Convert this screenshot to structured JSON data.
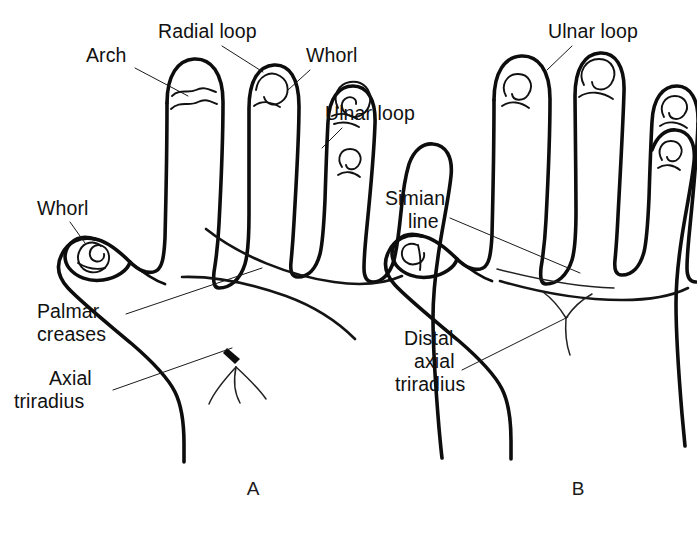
{
  "figure": {
    "background_color": "#ffffff",
    "ink_color": "#0d0d0d",
    "width": 697,
    "height": 533
  },
  "panels": [
    {
      "id": "A",
      "caption": "A",
      "caption_x": 253,
      "caption_y": 495,
      "description": "Normal hand with varied fingertip patterns, two palmar creases and an axial triradius"
    },
    {
      "id": "B",
      "caption": "B",
      "caption_x": 578,
      "caption_y": 495,
      "description": "Hand showing a single simian line and a distal axial triradius with ulnar loops on all digits"
    }
  ],
  "labels": [
    {
      "id": "arch",
      "text": "Arch",
      "panel": "A",
      "x": 86,
      "y": 62,
      "anchor": "start",
      "leader": [
        [
          135,
          68
        ],
        [
          188,
          96
        ]
      ]
    },
    {
      "id": "radial-loop",
      "text": "Radial loop",
      "panel": "A",
      "x": 158,
      "y": 38,
      "anchor": "start",
      "leader": [
        [
          222,
          46
        ],
        [
          263,
          72
        ]
      ]
    },
    {
      "id": "whorl-finger",
      "text": "Whorl",
      "panel": "A",
      "x": 306,
      "y": 62,
      "anchor": "start",
      "leader": [
        [
          310,
          70
        ],
        [
          288,
          90
        ]
      ]
    },
    {
      "id": "ulnar-loop-a",
      "text": "Ulnar loop",
      "panel": "A",
      "x": 325,
      "y": 120,
      "anchor": "start",
      "leader": [
        [
          342,
          128
        ],
        [
          322,
          148
        ]
      ]
    },
    {
      "id": "whorl-thumb",
      "text": "Whorl",
      "panel": "A",
      "x": 37,
      "y": 215,
      "anchor": "start",
      "leader": [
        [
          70,
          222
        ],
        [
          85,
          243
        ]
      ]
    },
    {
      "id": "palmar-creases",
      "text": [
        "Palmar",
        "creases"
      ],
      "panel": "A",
      "x": 37,
      "y": 318,
      "anchor": "start",
      "leader": [
        [
          126,
          314
        ],
        [
          262,
          268
        ]
      ]
    },
    {
      "id": "axial-triradius",
      "text": [
        "Axial",
        "triradius"
      ],
      "panel": "A",
      "x": 37,
      "y": 385,
      "anchor": "start",
      "leader": [
        [
          113,
          390
        ],
        [
          232,
          348
        ]
      ]
    },
    {
      "id": "ulnar-loop-b",
      "text": "Ulnar loop",
      "panel": "B",
      "x": 548,
      "y": 38,
      "anchor": "start",
      "leader": [
        [
          572,
          46
        ],
        [
          547,
          70
        ]
      ]
    },
    {
      "id": "simian-line",
      "text": [
        "Simian",
        "line"
      ],
      "panel": "B",
      "x": 385,
      "y": 205,
      "anchor": "start",
      "leader": [
        [
          450,
          218
        ],
        [
          580,
          273
        ]
      ]
    },
    {
      "id": "distal-axial-triradius",
      "text": [
        "Distal",
        "axial",
        "triradius"
      ],
      "panel": "B",
      "x": 395,
      "y": 345,
      "anchor": "start",
      "leader": [
        [
          462,
          370
        ],
        [
          568,
          317
        ]
      ]
    }
  ],
  "pattern_types": {
    "arch": "arch",
    "radial_loop": "radial-loop",
    "whorl": "whorl",
    "ulnar_loop": "ulnar-loop"
  },
  "fingertip_patterns": {
    "panel_A": [
      {
        "digit": "thumb",
        "pattern": "whorl"
      },
      {
        "digit": "index",
        "pattern": "arch"
      },
      {
        "digit": "middle",
        "pattern": "radial loop"
      },
      {
        "digit": "ring",
        "pattern": "whorl"
      },
      {
        "digit": "little",
        "pattern": "ulnar loop"
      }
    ],
    "panel_B": [
      {
        "digit": "thumb",
        "pattern": "ulnar loop"
      },
      {
        "digit": "index",
        "pattern": "ulnar loop"
      },
      {
        "digit": "middle",
        "pattern": "ulnar loop"
      },
      {
        "digit": "ring",
        "pattern": "ulnar loop"
      },
      {
        "digit": "little",
        "pattern": "ulnar loop"
      }
    ]
  },
  "palm_features": {
    "panel_A": [
      "distal palmar crease",
      "proximal palmar crease",
      "axial triradius"
    ],
    "panel_B": [
      "simian line (single transverse crease)",
      "distal axial triradius"
    ]
  }
}
